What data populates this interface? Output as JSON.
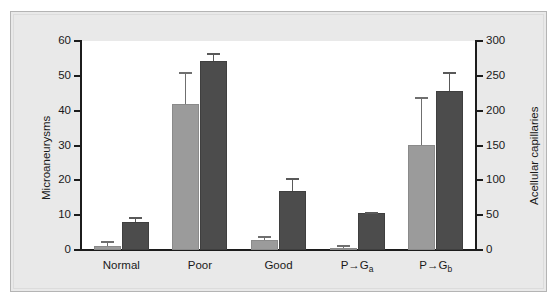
{
  "chart_data": {
    "type": "bar",
    "title": "",
    "subtitle": "",
    "categories": [
      "Normal",
      "Poor",
      "Good",
      "P→Ga",
      "P→Gb"
    ],
    "category_labels_html": [
      "Normal",
      "Poor",
      "Good",
      "P→G<sub>a</sub>",
      "P→G<sub>b</sub>"
    ],
    "grid": false,
    "legend": "none",
    "series": [
      {
        "name": "Microaneurysms",
        "axis": "left",
        "color": "#9b9b9b",
        "values": [
          1.2,
          42.0,
          3.0,
          0.5,
          30.2
        ],
        "errors": [
          1.3,
          9.2,
          1.1,
          0.9,
          13.8
        ]
      },
      {
        "name": "Acellular capillaries",
        "axis": "right",
        "color": "#4c4c4c",
        "values": [
          40,
          271,
          85,
          53,
          228
        ],
        "errors": [
          7,
          12,
          19,
          2,
          28
        ]
      }
    ],
    "left_axis": {
      "label": "Microaneurysms",
      "ticks": [
        0,
        10,
        20,
        30,
        40,
        50,
        60
      ],
      "min": 0,
      "max": 60
    },
    "right_axis": {
      "label": "Acellular capillaries",
      "ticks": [
        0,
        50,
        100,
        150,
        200,
        250,
        300
      ],
      "min": 0,
      "max": 300
    },
    "xlabel": ""
  }
}
